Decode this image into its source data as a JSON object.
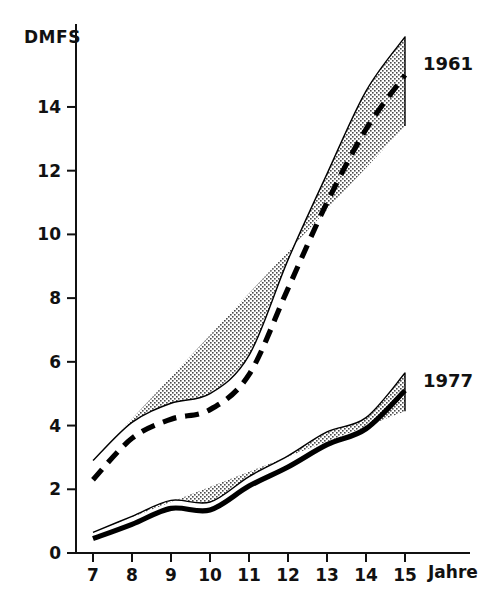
{
  "chart_data": {
    "type": "line",
    "title": "",
    "subtitle": "",
    "xlabel": "Jahre",
    "ylabel": "DMFS",
    "x": [
      7,
      8,
      9,
      10,
      11,
      12,
      13,
      14,
      15
    ],
    "xtick_labels": [
      "7",
      "8",
      "9",
      "10",
      "11",
      "12",
      "13",
      "14",
      "15"
    ],
    "ytick_labels": [
      "0",
      "2",
      "4",
      "6",
      "8",
      "10",
      "12",
      "14"
    ],
    "ytick_values": [
      0,
      2,
      4,
      6,
      8,
      10,
      12,
      14
    ],
    "xlim": [
      6.6,
      15.6
    ],
    "ylim": [
      0,
      16.6
    ],
    "grid": false,
    "legend_position": "inline-right-of-curves",
    "series": [
      {
        "name": "1961",
        "label": "1961",
        "linestyle": "dashed",
        "color": "#000000",
        "band_fill": "#d8d8d8",
        "values": [
          2.3,
          3.6,
          4.2,
          4.5,
          5.6,
          8.3,
          11.0,
          13.3,
          15.0
        ],
        "band_upper": [
          2.9,
          4.1,
          4.7,
          5.0,
          6.2,
          9.2,
          11.9,
          14.5,
          16.2
        ],
        "band_lower": [
          1.7,
          3.1,
          3.75,
          4.1,
          5.0,
          7.4,
          10.1,
          12.4,
          13.4
        ]
      },
      {
        "name": "1977",
        "label": "1977",
        "linestyle": "solid",
        "color": "#000000",
        "band_fill": "#d8d8d8",
        "values": [
          0.45,
          0.9,
          1.4,
          1.35,
          2.1,
          2.7,
          3.4,
          3.9,
          5.1
        ],
        "band_upper": [
          0.65,
          1.15,
          1.65,
          1.6,
          2.4,
          3.05,
          3.8,
          4.25,
          5.65
        ],
        "band_lower": [
          0.25,
          0.65,
          1.1,
          1.1,
          1.8,
          2.35,
          3.0,
          3.4,
          4.45
        ]
      }
    ]
  },
  "axes": {
    "y_axis_title": "DMFS",
    "x_axis_title": "Jahre"
  },
  "labels": {
    "series_1961": "1961",
    "series_1977": "1977"
  }
}
